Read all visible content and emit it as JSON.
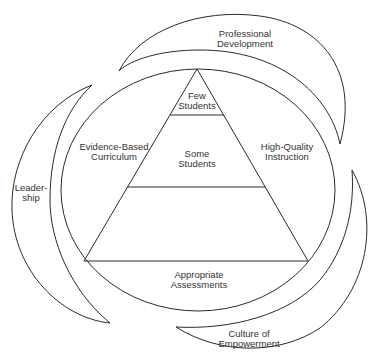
{
  "diagram": {
    "type": "pyramid-in-circle with surrounding crescents",
    "pyramid": {
      "top": {
        "line1": "Few",
        "line2": "Students"
      },
      "middle": {
        "line1": "Some",
        "line2": "Students"
      },
      "bottom": {
        "line1": "",
        "line2": ""
      }
    },
    "circle_labels": {
      "left": {
        "line1": "Evidence-Based",
        "line2": "Curriculum"
      },
      "right": {
        "line1": "High-Quality",
        "line2": "Instruction"
      },
      "bottom": {
        "line1": "Appropriate",
        "line2": "Assessments"
      }
    },
    "crescents": {
      "top": {
        "line1": "Professional",
        "line2": "Development"
      },
      "left": {
        "line1": "Leader-",
        "line2": "ship"
      },
      "bottom_right": {
        "line1": "Culture of",
        "line2": "Empowerment"
      }
    },
    "colors": {
      "stroke": "#2a2a2a",
      "text": "#333333",
      "background": "#ffffff"
    }
  }
}
